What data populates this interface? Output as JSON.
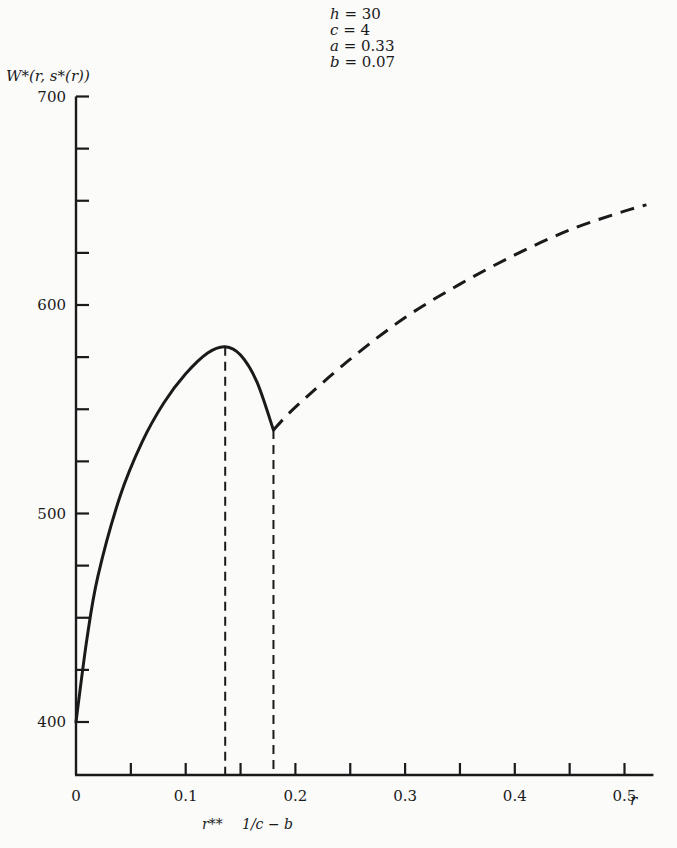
{
  "chart_data": {
    "type": "line",
    "title": "",
    "parameters": [
      {
        "name": "h",
        "value": "30"
      },
      {
        "name": "c",
        "value": "4"
      },
      {
        "name": "a",
        "value": "0.33"
      },
      {
        "name": "b",
        "value": "0.07"
      }
    ],
    "ylabel": "W*(r, s*(r))",
    "xlabel": "r",
    "xlim": [
      0,
      0.52
    ],
    "ylim": [
      375,
      700
    ],
    "x_ticks": [
      0,
      0.05,
      0.1,
      0.15,
      0.2,
      0.25,
      0.3,
      0.35,
      0.4,
      0.45,
      0.5
    ],
    "x_tick_labels": [
      "0",
      "0.1",
      "0.2",
      "0.3",
      "0.4",
      "0.5"
    ],
    "y_ticks": [
      400,
      425,
      450,
      475,
      500,
      525,
      550,
      575,
      600,
      625,
      650,
      675,
      700
    ],
    "y_tick_labels": [
      "400",
      "500",
      "600",
      "700"
    ],
    "grid": false,
    "annotations": [
      {
        "label": "r**",
        "x": 0.136,
        "style": "dashed vertical line at maximum"
      },
      {
        "label": "1/c − b",
        "x": 0.18,
        "style": "dashed vertical line at discontinuity"
      }
    ],
    "series": [
      {
        "name": "solid segment (0 ≤ r ≤ 1/c − b)",
        "style": "solid",
        "x": [
          0,
          0.01,
          0.02,
          0.04,
          0.06,
          0.08,
          0.1,
          0.12,
          0.136,
          0.15,
          0.165,
          0.18
        ],
        "values": [
          400,
          440,
          470,
          508,
          534,
          553,
          567,
          577,
          580,
          576,
          563,
          540
        ]
      },
      {
        "name": "dashed segment (r > 1/c − b)",
        "style": "dashed",
        "x": [
          0.18,
          0.2,
          0.25,
          0.3,
          0.35,
          0.4,
          0.45,
          0.5,
          0.52
        ],
        "values": [
          540,
          551,
          574,
          594,
          610,
          624,
          636,
          645,
          648
        ]
      }
    ]
  }
}
